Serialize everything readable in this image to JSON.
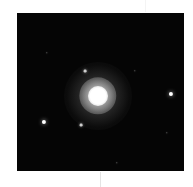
{
  "image": {
    "subject": "globular star cluster",
    "background_color": "#050505",
    "frame": {
      "x": 17,
      "y": 13,
      "width": 167,
      "height": 158
    },
    "core": {
      "x": 81,
      "y": 83,
      "radius": 10,
      "halo_radius": 34,
      "color": "#ffffff"
    },
    "stars": [
      {
        "x": 154,
        "y": 81,
        "size": 3
      },
      {
        "x": 27,
        "y": 109,
        "size": 3
      },
      {
        "x": 68,
        "y": 58,
        "size": 2
      },
      {
        "x": 64,
        "y": 112,
        "size": 2
      },
      {
        "x": 150,
        "y": 120,
        "size": 1
      },
      {
        "x": 118,
        "y": 58,
        "size": 1
      },
      {
        "x": 30,
        "y": 40,
        "size": 1
      },
      {
        "x": 100,
        "y": 150,
        "size": 1
      }
    ]
  }
}
